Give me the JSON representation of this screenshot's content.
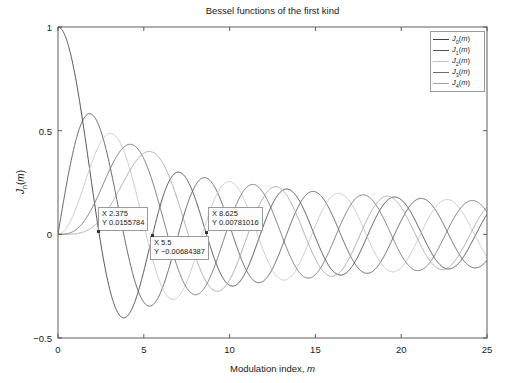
{
  "chart_data": {
    "type": "line",
    "title": "Bessel functions of the first kind",
    "xlabel": "Modulation index, m",
    "ylabel": "Jn(m)",
    "xlim": [
      0,
      25
    ],
    "ylim": [
      -0.5,
      1
    ],
    "xticks": [
      "0",
      "5",
      "10",
      "15",
      "20",
      "25"
    ],
    "xtick_values": [
      0,
      5,
      10,
      15,
      20,
      25
    ],
    "yticks": [
      "1",
      "0.5",
      "0",
      "-0.5"
    ],
    "ytick_values": [
      1,
      0.5,
      0,
      -0.5
    ],
    "grid": false,
    "legend_position": "top-right",
    "series": [
      {
        "name": "J0(m)",
        "order": 0,
        "color": "#3f3f3f"
      },
      {
        "name": "J1(m)",
        "order": 1,
        "color": "#555555"
      },
      {
        "name": "J2(m)",
        "order": 2,
        "color": "#c3c3c3"
      },
      {
        "name": "J3(m)",
        "order": 3,
        "color": "#6b6b6b"
      },
      {
        "name": "J4(m)",
        "order": 4,
        "color": "#a0a0a0"
      }
    ],
    "annotations": [
      {
        "x_label": "X 2.375",
        "y_label": "Y 0.0155784",
        "x": 2.375,
        "y": 0.0155784
      },
      {
        "x_label": "X 5.5",
        "y_label": "Y −0.00684387",
        "x": 5.5,
        "y": -0.00684387
      },
      {
        "x_label": "X 8.625",
        "y_label": "Y 0.00781016",
        "x": 8.625,
        "y": 0.00781016
      }
    ]
  },
  "legend": {
    "items": [
      {
        "label_base": "J",
        "label_sub": "0",
        "label_tail": "(m)"
      },
      {
        "label_base": "J",
        "label_sub": "1",
        "label_tail": "(m)"
      },
      {
        "label_base": "J",
        "label_sub": "2",
        "label_tail": "(m)"
      },
      {
        "label_base": "J",
        "label_sub": "3",
        "label_tail": "(m)"
      },
      {
        "label_base": "J",
        "label_sub": "4",
        "label_tail": "(m)"
      }
    ]
  },
  "axes": {
    "y_label_base": "J",
    "y_label_sub": "n",
    "y_label_tail": "(m)",
    "x_label_text": "Modulation index, ",
    "x_label_italic": "m"
  },
  "colors": {
    "axis": "#4d4d4d",
    "text": "#1a1a1a",
    "background": "#ffffff",
    "tip_border": "#9a9a9a"
  }
}
